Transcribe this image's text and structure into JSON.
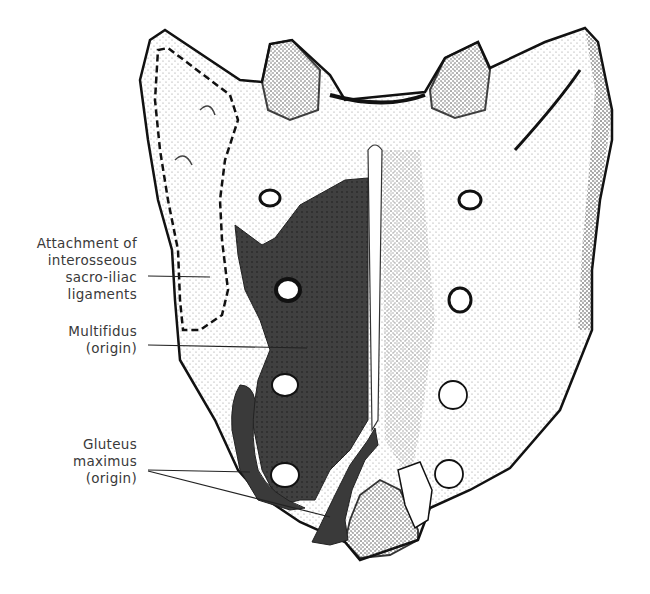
{
  "figure": {
    "colors": {
      "bone_outline": "#111111",
      "bone_fill": "#ffffff",
      "stipple": "#222222",
      "muscle_shading": "#3f3f3f",
      "label_text": "#3a3a3a",
      "leader_line": "#222222"
    }
  },
  "labels": {
    "interosseous": {
      "lines": [
        "Attachment of",
        "interosseous",
        "sacro-iliac",
        "ligaments"
      ]
    },
    "multifidus": {
      "lines": [
        "Multifidus",
        "(origin)"
      ]
    },
    "gluteus": {
      "lines": [
        "Gluteus",
        "maximus",
        "(origin)"
      ]
    }
  }
}
